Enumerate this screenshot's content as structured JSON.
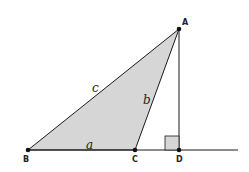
{
  "diagram": {
    "type": "geometry-triangle-with-altitude",
    "colors": {
      "fill": "#d6d6d6",
      "stroke": "#1a1a1a",
      "background": "#ffffff"
    },
    "points": {
      "A": {
        "label": "A",
        "x": 179,
        "y": 29
      },
      "B": {
        "label": "B",
        "x": 28,
        "y": 150
      },
      "C": {
        "label": "C",
        "x": 135,
        "y": 150
      },
      "D": {
        "label": "D",
        "x": 179,
        "y": 150
      }
    },
    "sides": {
      "a": {
        "label": "a",
        "between": [
          "B",
          "C"
        ]
      },
      "b": {
        "label": "b",
        "between": [
          "C",
          "A"
        ]
      },
      "c": {
        "label": "c",
        "between": [
          "B",
          "A"
        ]
      }
    },
    "altitude": {
      "from": "A",
      "to": "D",
      "right_angle_marker": true
    },
    "baseline": {
      "from_x": 28,
      "to_x": 238,
      "y": 150
    }
  }
}
